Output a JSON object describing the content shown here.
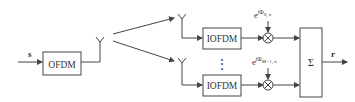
{
  "diagram": {
    "input_label": "s",
    "output_label": "r",
    "transmitter_block": "OFDM",
    "receiver_blocks": [
      "IOFDM",
      "IOFDM"
    ],
    "phase_labels": [
      {
        "base": "e",
        "exp_prefix": "j",
        "phi": "Φ",
        "sub": "0, n"
      },
      {
        "base": "e",
        "exp_prefix": "j",
        "phi": "Φ",
        "sub": "M−1, n"
      }
    ],
    "ellipsis": "⋮",
    "sum_symbol": "Σ",
    "multiply_symbol": "⊗",
    "colors": {
      "line": "#444444",
      "text": "#333333",
      "background": "#ffffff"
    }
  }
}
